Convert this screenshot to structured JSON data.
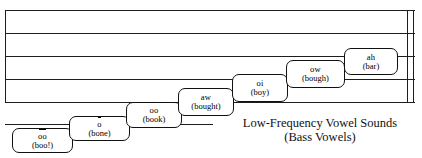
{
  "figure": {
    "staff": {
      "line_count": 5,
      "end_barline": "double"
    },
    "caption": {
      "line1": "Low-Frequency Vowel Sounds",
      "line2": "(Bass Vowels)"
    },
    "vowels": [
      {
        "symbol": "oo",
        "diacritic": "macron",
        "word": "(boo!)"
      },
      {
        "symbol": "o",
        "diacritic": "macron",
        "word": "(bone)"
      },
      {
        "symbol": "oo",
        "diacritic": "breve",
        "word": "(book)"
      },
      {
        "symbol": "aw",
        "diacritic": "none",
        "word": "(bought)"
      },
      {
        "symbol": "oi",
        "diacritic": "none",
        "word": "(boy)"
      },
      {
        "symbol": "ow",
        "diacritic": "none",
        "word": "(bough)"
      },
      {
        "symbol": "ah",
        "diacritic": "none",
        "word": "(bar)"
      }
    ],
    "colors": {
      "ink": "#111111",
      "paper": "#ffffff"
    }
  }
}
